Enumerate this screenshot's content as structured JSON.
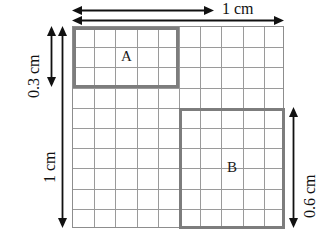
{
  "figure": {
    "grid": {
      "columns": 10,
      "rows": 10,
      "line_color": "#9a9a9a",
      "border_color": "#8d8d8d"
    },
    "rectangles": [
      {
        "label": "A",
        "col_start": 1,
        "col_span": 5,
        "row_start": 1,
        "row_span": 3,
        "width_cm": "0.5 cm",
        "height_cm": "0.3 cm",
        "border_color": "#7d7d7d"
      },
      {
        "label": "B",
        "col_start": 6,
        "col_span": 5,
        "row_start": 5,
        "row_span": 6,
        "width_cm": "0.5 cm",
        "height_cm": "0.6 cm",
        "border_color": "#7d7d7d"
      }
    ],
    "dimensions": {
      "top_inner": {
        "label": "",
        "description": "arrow spanning left half of grid top"
      },
      "top_full": {
        "label": "1 cm",
        "description": "arrow spanning full grid width"
      },
      "left_short": {
        "label": "0.3 cm",
        "description": "arrow spanning height of rectangle A"
      },
      "left_full": {
        "label": "1 cm",
        "description": "arrow spanning full grid height"
      },
      "right": {
        "label": "0.6 cm",
        "description": "arrow spanning height of rectangle B"
      }
    }
  }
}
